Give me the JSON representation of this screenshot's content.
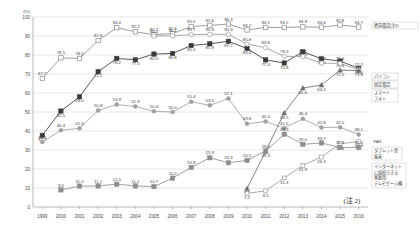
{
  "chart_data": {
    "type": "line",
    "title": "",
    "xlabel": "",
    "ylabel": "(%)",
    "ylim": [
      0,
      100
    ],
    "yticks": [
      0,
      10,
      20,
      30,
      40,
      50,
      60,
      70,
      80,
      90,
      100
    ],
    "grid": true,
    "legend_position": "right",
    "note": "(注 2)",
    "categories": [
      "1999",
      "2000",
      "2001",
      "2002",
      "2003",
      "2004",
      "2005",
      "2006",
      "2007",
      "2008",
      "2009",
      "2010",
      "2011",
      "2012",
      "2013",
      "2014",
      "2015",
      "2016"
    ],
    "series": [
      {
        "name": "携帯電話(注1)",
        "marker": "open-square",
        "color": "#8c8c8c",
        "values": [
          67.7,
          78.5,
          78.2,
          87.6,
          94.4,
          92.2,
          90.7,
          91.3,
          95.0,
          95.6,
          96.3,
          93.2,
          94.5,
          94.5,
          94.8,
          94.6,
          95.8,
          94.7
        ]
      },
      {
        "name": "パソコン",
        "marker": "filled-square",
        "color": "#3a3a3a",
        "values": [
          37.7,
          50.5,
          58.0,
          71.2,
          78.2,
          77.5,
          80.5,
          80.8,
          85.0,
          85.9,
          87.2,
          83.4,
          77.4,
          75.8,
          81.7,
          78.0,
          76.8,
          73.0
        ]
      },
      {
        "name": "固定電話",
        "marker": "open-circle",
        "color": "#9a9a9a",
        "values": [
          null,
          null,
          null,
          null,
          null,
          null,
          90.0,
          90.1,
          90.7,
          90.9,
          90.9,
          85.8,
          83.8,
          79.3,
          79.1,
          75.7,
          75.6,
          72.2
        ]
      },
      {
        "name": "スマートフォン",
        "marker": "filled-triangle",
        "color": "#6e6e6e",
        "values": [
          null,
          null,
          null,
          null,
          null,
          null,
          null,
          null,
          null,
          null,
          null,
          9.7,
          29.3,
          49.5,
          62.6,
          64.2,
          72.0,
          71.8
        ]
      },
      {
        "name": "FAX",
        "marker": "filled-circle",
        "color": "#a0a0a0",
        "values": [
          34.2,
          40.4,
          41.4,
          50.8,
          53.9,
          52.9,
          50.4,
          50.0,
          55.4,
          53.5,
          57.1,
          43.8,
          45.0,
          41.5,
          46.4,
          41.8,
          42.0,
          38.1
        ]
      },
      {
        "name": "タブレット型端末",
        "marker": "open-square-small",
        "color": "#9c9c9c",
        "values": [
          null,
          null,
          null,
          null,
          null,
          null,
          null,
          null,
          null,
          null,
          null,
          7.2,
          8.5,
          15.3,
          21.9,
          26.3,
          33.3,
          34.4
        ]
      },
      {
        "name": "インターネットに接続できる家庭用テレビゲーム機",
        "marker": "filled-square-gray",
        "color": "#8e8e8e",
        "values": [
          null,
          9.0,
          11.0,
          11.1,
          12.0,
          11.1,
          10.7,
          15.2,
          20.8,
          25.9,
          23.3,
          24.5,
          29.5,
          38.3,
          33.0,
          33.7,
          31.3,
          31.4
        ]
      }
    ],
    "legend_entries": [
      {
        "label": "携帯電話(注1)"
      },
      {
        "label": "パソコン"
      },
      {
        "label": "固定電話"
      },
      {
        "label": "スマートフォン"
      },
      {
        "label": "FAX"
      },
      {
        "label": "タブレット型端末"
      },
      {
        "label": "インターネットに接続できる家庭用テレビゲーム機"
      }
    ]
  }
}
